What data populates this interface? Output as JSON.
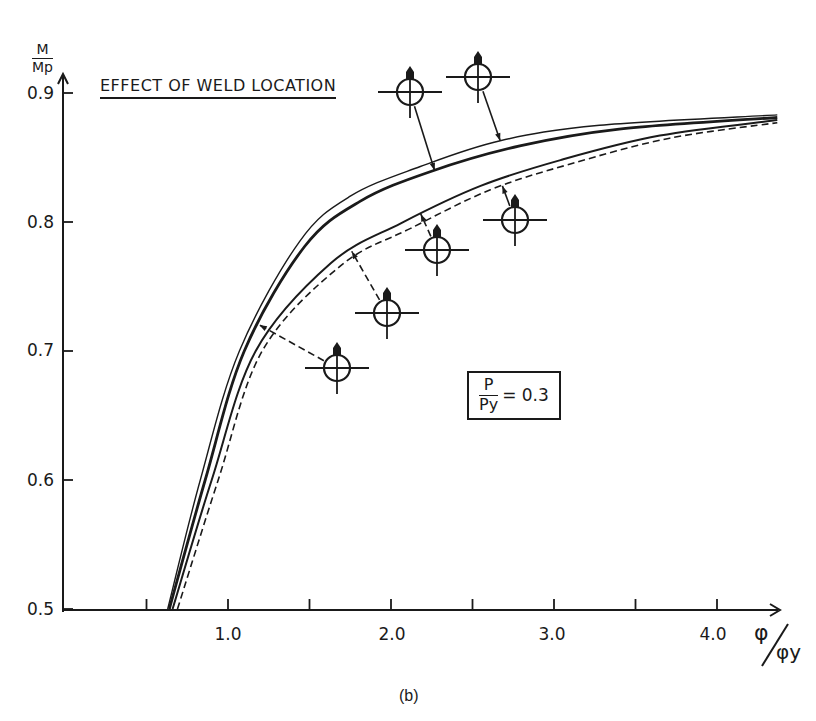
{
  "chart_data": {
    "type": "line",
    "title": "EFFECT OF WELD LOCATION",
    "subtitle": "(b)",
    "xlabel": "φ/φy",
    "ylabel": "M/Mp",
    "xlim": [
      0,
      4.4
    ],
    "ylim": [
      0.5,
      0.9
    ],
    "x_ticks": [
      0.5,
      1.0,
      1.5,
      2.0,
      2.5,
      3.0,
      3.5,
      4.0
    ],
    "x_tick_labels": [
      "1.0",
      "2.0",
      "3.0",
      "4.0"
    ],
    "y_ticks": [
      0.5,
      0.6,
      0.7,
      0.8,
      0.9
    ],
    "y_tick_labels": [
      "0.5",
      "0.6",
      "0.7",
      "0.8",
      "0.9"
    ],
    "grid": false,
    "annotation": "P/Py = 0.3",
    "series": [
      {
        "name": "Weld location curve 1 (thin solid, outer)",
        "style": "thin-solid",
        "x": [
          0.63,
          0.83,
          1.07,
          1.44,
          1.75,
          2.18,
          2.67,
          3.28,
          4.37
        ],
        "y": [
          0.5,
          0.6,
          0.7,
          0.785,
          0.82,
          0.843,
          0.863,
          0.875,
          0.883
        ]
      },
      {
        "name": "Weld location curve 2 (thick solid)",
        "style": "thick-solid",
        "x": [
          0.64,
          0.86,
          1.1,
          1.47,
          1.81,
          2.24,
          2.79,
          3.4,
          4.37
        ],
        "y": [
          0.5,
          0.6,
          0.7,
          0.781,
          0.816,
          0.839,
          0.859,
          0.872,
          0.881
        ]
      },
      {
        "name": "Weld location curve 3 (thin solid, inner)",
        "style": "solid",
        "x": [
          0.66,
          0.9,
          1.17,
          1.63,
          2.06,
          2.55,
          3.04,
          3.65,
          4.37
        ],
        "y": [
          0.5,
          0.6,
          0.7,
          0.768,
          0.799,
          0.828,
          0.848,
          0.867,
          0.879
        ]
      },
      {
        "name": "Weld location curve 4 (dashed)",
        "style": "dashed",
        "x": [
          0.69,
          0.94,
          1.21,
          1.69,
          2.12,
          2.61,
          3.1,
          3.71,
          4.37
        ],
        "y": [
          0.5,
          0.6,
          0.7,
          0.766,
          0.795,
          0.825,
          0.845,
          0.865,
          0.877
        ]
      }
    ],
    "markers": [
      {
        "id": "A",
        "center_px": [
          337,
          368
        ],
        "leader": "dashed",
        "points_to_series": 2
      },
      {
        "id": "B",
        "center_px": [
          387,
          313
        ],
        "leader": "dashed",
        "points_to_series": 3
      },
      {
        "id": "C",
        "center_px": [
          437,
          250
        ],
        "leader": "dashed",
        "points_to_series": 3
      },
      {
        "id": "D",
        "center_px": [
          515,
          220
        ],
        "leader": "solid",
        "points_to_series": 4
      },
      {
        "id": "E",
        "center_px": [
          410,
          92
        ],
        "leader": "solid",
        "points_to_series": 2
      },
      {
        "id": "F",
        "center_px": [
          478,
          77
        ],
        "leader": "solid",
        "points_to_series": 1
      }
    ]
  },
  "labels": {
    "ylabel_num": "M",
    "ylabel_den": "Mp",
    "xlabel_num": "φ",
    "xlabel_den": "φy",
    "title": "EFFECT OF WELD LOCATION",
    "caption": "(b)",
    "p_num": "P",
    "p_den": "Py",
    "p_value": "= 0.3",
    "yticks": [
      "0.9",
      "0.8",
      "0.7",
      "0.6",
      "0.5"
    ],
    "xticks": [
      "1.0",
      "2.0",
      "3.0",
      "4.0"
    ]
  }
}
